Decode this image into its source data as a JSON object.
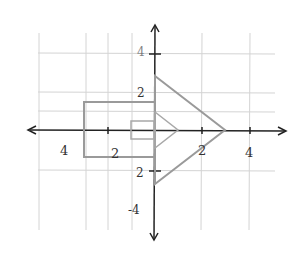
{
  "diagram": {
    "type": "coordinate-plane",
    "x_labels": [
      {
        "text": "4",
        "x": 64,
        "y": 154
      },
      {
        "text": "2",
        "x": 114,
        "y": 158
      },
      {
        "text": "2",
        "x": 202,
        "y": 154
      },
      {
        "text": "4",
        "x": 250,
        "y": 156
      }
    ],
    "y_labels": [
      {
        "text": "4",
        "x": 140,
        "y": 56
      },
      {
        "text": "2",
        "x": 140,
        "y": 96
      },
      {
        "text": "2",
        "x": 140,
        "y": 176
      },
      {
        "text": "-4",
        "x": 134,
        "y": 214
      }
    ],
    "shapes": {
      "large_arrow": "rectangle (-3,-1)..(0,1) with triangle (0,2.3),(0,-2.3),(3,0)",
      "small_arrow": "rectangle (-1,-0.4)..(0,0.4) with triangle (0,1),(0,-1),(1,0)"
    },
    "colors": {
      "axis": "#222222",
      "grid": "#cccccc",
      "shape": "#999999",
      "small_shape": "#aaaaaa"
    }
  }
}
